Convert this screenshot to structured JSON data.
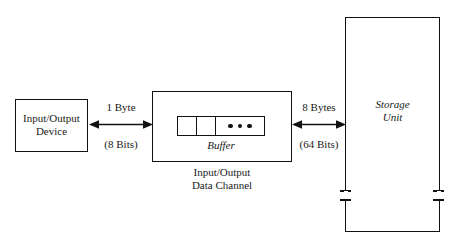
{
  "diagram": {
    "background_color": "#ffffff",
    "line_color": "#111111",
    "text_color": "#1a1a1a"
  },
  "nodes": {
    "io_device": {
      "label": "Input/Output\nDevice"
    },
    "data_channel": {
      "caption": "Input/Output\nData Channel",
      "buffer_label": "Buffer",
      "buffer_cells": [
        {
          "content": "",
          "width": "narrow"
        },
        {
          "content": "",
          "width": "narrow"
        },
        {
          "content": "dots",
          "width": "wide"
        }
      ]
    },
    "storage_unit": {
      "label": "Storage\nUnit"
    }
  },
  "connections": {
    "device_to_channel": {
      "top_label": "1 Byte",
      "bottom_label": "(8 Bits)",
      "style": "double-headed-arrow"
    },
    "channel_to_storage": {
      "top_label": "8 Bytes",
      "bottom_label": "(64 Bits)",
      "style": "double-headed-arrow"
    }
  }
}
